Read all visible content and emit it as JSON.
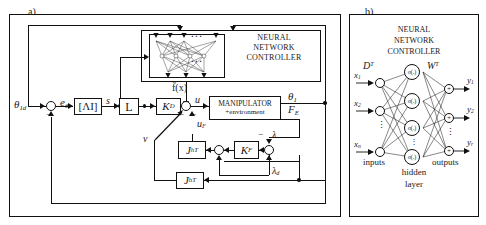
{
  "figure": {
    "panel_a_label": "a)",
    "panel_b_label": "b)"
  },
  "panel_a": {
    "nn_controller_title_line1": "NEURAL",
    "nn_controller_title_line2": "NETWORK",
    "nn_controller_title_line3": "CONTROLLER",
    "manipulator_line1": "MANIPULATOR",
    "manipulator_line2": "+environment",
    "blocks": {
      "lambda_i": "[ΛI]",
      "l_gain": "L",
      "kd_gain": "K",
      "kd_gain_sub": "D",
      "kf_gain": "K",
      "kf_gain_sub": "F",
      "jh_transpose": "J",
      "jh_transpose_sub": "h",
      "jh_transpose_sup": "T",
      "j_hT": "J",
      "j_hT_sup": "hT"
    },
    "signals": {
      "theta_1d": "θ",
      "theta_1d_sub": "1d",
      "e_theta": "e",
      "e_theta_sub": "θ",
      "s": "s",
      "f_hat": "f̂(x)",
      "u": "u",
      "u_F": "u",
      "u_F_sub": "F",
      "v": "v",
      "theta_1": "θ",
      "theta_1_sub": "1",
      "F_E": "F",
      "F_E_sub": "E",
      "lambda": "λ",
      "lambda_d": "λ",
      "lambda_d_sub": "d",
      "minus": "−"
    }
  },
  "panel_b": {
    "title_line1": "NEURAL",
    "title_line2": "NETWORK",
    "title_line3": "CONTROLLER",
    "weight_in": "D",
    "weight_in_sup": "T",
    "weight_out": "W",
    "weight_out_sup": "T",
    "inputs_label": "inputs",
    "hidden_label_line1": "hidden",
    "hidden_label_line2": "layer",
    "outputs_label": "outputs",
    "input_nodes": [
      {
        "label": "x",
        "sub": "1"
      },
      {
        "label": "x",
        "sub": "2"
      },
      {
        "label": "x",
        "sub": "n"
      }
    ],
    "hidden_nodes": [
      {
        "label": "σ(.)",
        "sub": "1"
      },
      {
        "label": "σ(.)",
        "sub": "2"
      },
      {
        "label": "σ(.)",
        "sub": "3"
      },
      {
        "label": "σ(.)",
        "sub": "N"
      }
    ],
    "output_nodes": [
      {
        "label": "y",
        "sub": "1"
      },
      {
        "label": "y",
        "sub": "2"
      },
      {
        "label": "y",
        "sub": "r"
      }
    ],
    "sum_glyph": "+",
    "vdots": "⋮"
  },
  "colors": {
    "line": "#111111",
    "background": "#ffffff"
  }
}
